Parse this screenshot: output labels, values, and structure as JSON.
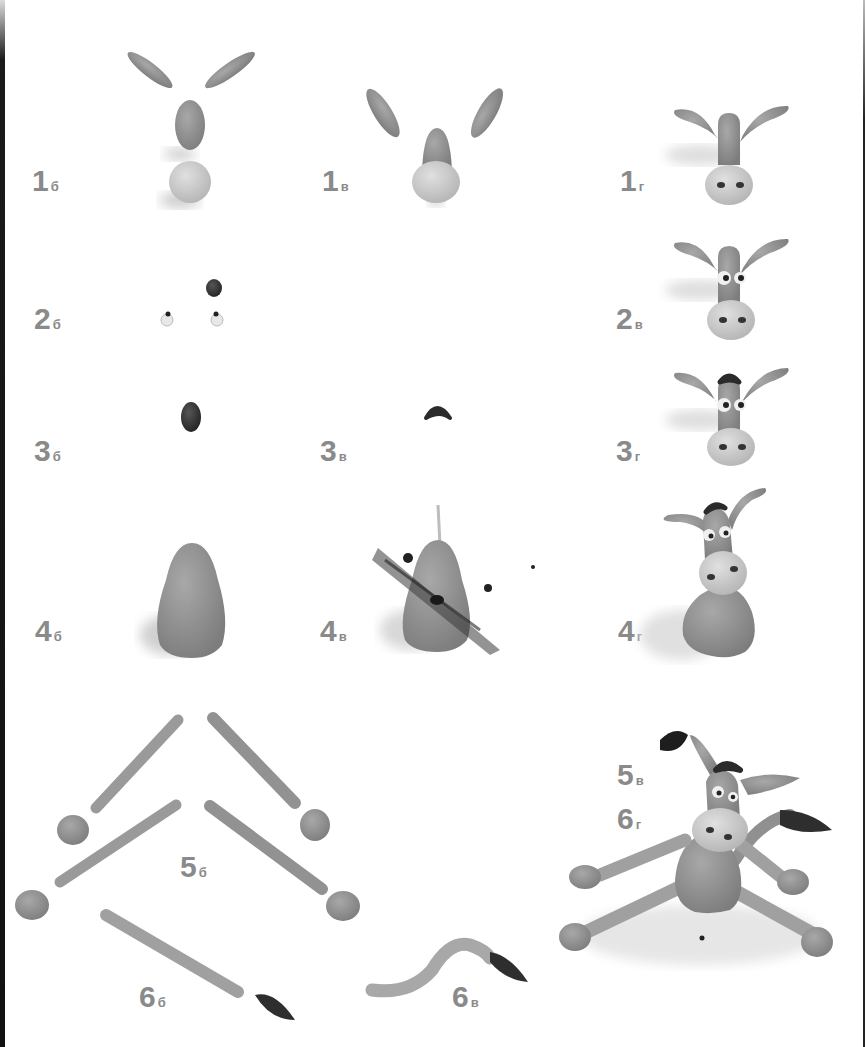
{
  "page": {
    "colors": {
      "background": "#ffffff",
      "label": "#8a8a8a",
      "clay_mid": "#8f8f8f",
      "clay_light": "#c9c9c9",
      "clay_dark": "#3a3a3a"
    }
  },
  "steps": [
    {
      "id": "1b",
      "num": "1",
      "sub": "б",
      "caption": "ears, muzzle shape and snout ball"
    },
    {
      "id": "1v",
      "num": "1",
      "sub": "в",
      "caption": "head assembled with snout"
    },
    {
      "id": "1g",
      "num": "1",
      "sub": "г",
      "caption": "head with ears and nostrils"
    },
    {
      "id": "2b",
      "num": "2",
      "sub": "б",
      "caption": "eyes and forelock pieces"
    },
    {
      "id": "2v",
      "num": "2",
      "sub": "в",
      "caption": "head with eyes"
    },
    {
      "id": "3b",
      "num": "3",
      "sub": "б",
      "caption": "dark oval for forelock"
    },
    {
      "id": "3v",
      "num": "3",
      "sub": "в",
      "caption": "shaped forelock"
    },
    {
      "id": "3g",
      "num": "3",
      "sub": "г",
      "caption": "head with forelock"
    },
    {
      "id": "4b",
      "num": "4",
      "sub": "б",
      "caption": "pear-shaped body"
    },
    {
      "id": "4v",
      "num": "4",
      "sub": "в",
      "caption": "body with toothpick"
    },
    {
      "id": "4g",
      "num": "4",
      "sub": "г",
      "caption": "head on body"
    },
    {
      "id": "5b",
      "num": "5",
      "sub": "б",
      "caption": "legs and hooves"
    },
    {
      "id": "5v",
      "num": "5",
      "sub": "в",
      "caption": "assembled donkey"
    },
    {
      "id": "6b",
      "num": "6",
      "sub": "б",
      "caption": "tail and tassel"
    },
    {
      "id": "6v",
      "num": "6",
      "sub": "в",
      "caption": "bent tail with tassel"
    },
    {
      "id": "6g",
      "num": "6",
      "sub": "г",
      "caption": "finished donkey"
    }
  ]
}
